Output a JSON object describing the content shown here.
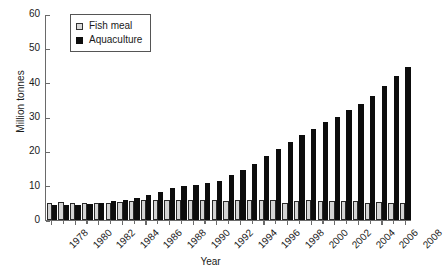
{
  "chart_data": {
    "type": "bar",
    "title": "",
    "xlabel": "Year",
    "ylabel": "Million tonnes",
    "ylim": [
      0,
      60
    ],
    "yticks": [
      0,
      10,
      20,
      30,
      40,
      50,
      60
    ],
    "grid": false,
    "legend_position": "top-left",
    "categories": [
      "1978",
      "1979",
      "1980",
      "1981",
      "1982",
      "1983",
      "1984",
      "1985",
      "1986",
      "1987",
      "1988",
      "1989",
      "1990",
      "1991",
      "1992",
      "1993",
      "1994",
      "1995",
      "1996",
      "1997",
      "1998",
      "1999",
      "2000",
      "2001",
      "2002",
      "2003",
      "2004",
      "2005",
      "2006",
      "2007",
      "2008"
    ],
    "xtick_labels": [
      "1978",
      "1980",
      "1982",
      "1984",
      "1986",
      "1988",
      "1990",
      "1992",
      "1994",
      "1996",
      "1998",
      "2000",
      "2002",
      "2004",
      "2006",
      "2008"
    ],
    "series": [
      {
        "name": "Fish meal",
        "color": "#d4d4d4",
        "values": [
          4.9,
          5.2,
          4.9,
          4.9,
          5.0,
          5.1,
          5.3,
          5.5,
          5.8,
          5.8,
          5.8,
          5.8,
          5.7,
          5.7,
          5.7,
          5.6,
          5.9,
          5.7,
          5.7,
          5.8,
          5.1,
          5.6,
          5.8,
          5.6,
          5.5,
          5.5,
          5.4,
          5.1,
          5.2,
          5.0,
          5.0
        ]
      },
      {
        "name": "Aquaculture",
        "color": "#0d0d0d",
        "values": [
          4.3,
          4.4,
          4.4,
          4.7,
          5.0,
          5.4,
          5.8,
          6.3,
          7.4,
          8.3,
          9.2,
          9.8,
          10.3,
          10.8,
          11.5,
          13.0,
          14.7,
          16.3,
          18.5,
          20.8,
          22.8,
          24.8,
          26.5,
          28.5,
          30.1,
          32.0,
          33.7,
          36.0,
          39.0,
          41.9,
          44.5
        ]
      }
    ]
  },
  "legend": {
    "items": [
      {
        "label": "Fish meal",
        "marker": "open-square-icon"
      },
      {
        "label": "Aquaculture",
        "marker": "filled-square-icon"
      }
    ]
  }
}
